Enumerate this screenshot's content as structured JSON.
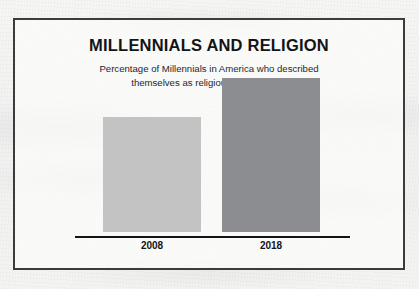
{
  "chart_data": {
    "type": "bar",
    "title": "MILLENNIALS AND RELIGION",
    "subtitle_line1": "Percentage of Millennials in America who described",
    "subtitle_line2": "themselves as religiously unaffiliated",
    "xlabel": "",
    "ylabel": "",
    "ylim": [
      0,
      50
    ],
    "grid": false,
    "legend": "none",
    "categories": [
      "2008",
      "2018"
    ],
    "values": [
      31.9,
      42.7
    ],
    "value_labels": [
      "31.9%",
      "42.7%"
    ],
    "bar_colors": [
      "#c3c3c3",
      "#8b8d90"
    ]
  },
  "style": {
    "frame_border_color": "#3c3c40",
    "axis_color": "#141417",
    "text_color": "#141417",
    "background_color": "#f3f3f1"
  }
}
